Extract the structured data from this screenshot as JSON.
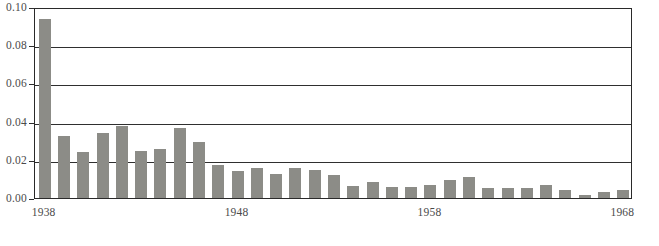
{
  "chart_data": {
    "type": "bar",
    "title": "",
    "subtitle": "",
    "xlabel": "",
    "ylabel": "",
    "grid": "horizontal",
    "legend": "none",
    "xlim": [
      1937.5,
      1968.5
    ],
    "ylim": [
      0.0,
      0.1
    ],
    "ytick_labels": [
      "0.00",
      "0.02",
      "0.04",
      "0.06",
      "0.08",
      "0.10"
    ],
    "ytick_values": [
      0.0,
      0.02,
      0.04,
      0.06,
      0.08,
      0.1
    ],
    "xtick_labels": [
      "1938",
      "1948",
      "1958",
      "1968"
    ],
    "xtick_values": [
      1938,
      1948,
      1958,
      1968
    ],
    "bar_color": "#8c8c87",
    "axis_color": "#2f2f2f",
    "label_color": "#4a4a4a",
    "categories": [
      "1938",
      "1939",
      "1940",
      "1941",
      "1942",
      "1943",
      "1944",
      "1945",
      "1946",
      "1947",
      "1948",
      "1949",
      "1950",
      "1951",
      "1952",
      "1953",
      "1954",
      "1955",
      "1956",
      "1957",
      "1958",
      "1959",
      "1960",
      "1961",
      "1962",
      "1963",
      "1964",
      "1965",
      "1966",
      "1967",
      "1968"
    ],
    "values": [
      0.0935,
      0.0325,
      0.0243,
      0.034,
      0.0375,
      0.0245,
      0.0258,
      0.0365,
      0.0295,
      0.0175,
      0.014,
      0.0155,
      0.0125,
      0.0158,
      0.0148,
      0.0118,
      0.0065,
      0.0083,
      0.006,
      0.006,
      0.0068,
      0.0095,
      0.011,
      0.0052,
      0.0055,
      0.0055,
      0.007,
      0.0042,
      0.0015,
      0.0032,
      0.0042
    ]
  }
}
